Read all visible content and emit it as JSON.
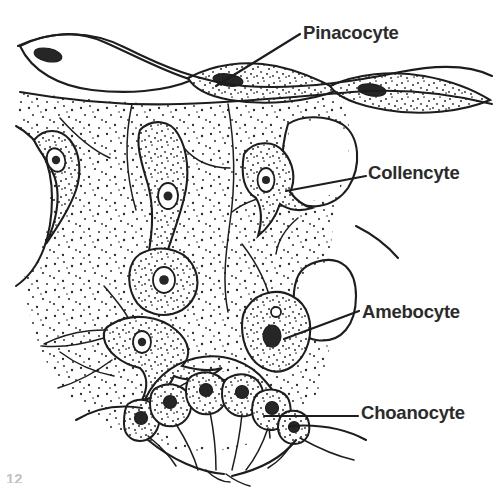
{
  "figure": {
    "corner_mark": "12",
    "ink_color": "#1d1d1d",
    "label_color": "#2b2b2b",
    "background_color": "#ffffff",
    "stipple_color": "#2a2a2a"
  },
  "labels": [
    {
      "id": "pinacocyte",
      "text": "Pinacocyte",
      "leader_from": [
        216,
        86
      ],
      "leader_to": [
        300,
        34
      ],
      "describes": "flattened surface epithelial cell of the sponge pinacoderm"
    },
    {
      "id": "collencyte",
      "text": "Collencyte",
      "leader_from": [
        286,
        191
      ],
      "leader_to": [
        366,
        176
      ],
      "describes": "stellate collagen-secreting cell with long tapering processes"
    },
    {
      "id": "amebocyte",
      "text": "Amebocyte",
      "leader_from": [
        284,
        339
      ],
      "leader_to": [
        359,
        311
      ],
      "describes": "rounded motile wandering cell in the mesohyl"
    },
    {
      "id": "choanocyte",
      "text": "Choanocyte",
      "leader_from": [
        264,
        416
      ],
      "leader_to": [
        358,
        416
      ],
      "describes": "flagellated collar cell lining the choanocyte chamber"
    }
  ],
  "regions": [
    {
      "id": "mesohyl",
      "name": "mesohyl",
      "texture": "stippled"
    },
    {
      "id": "canal-left",
      "name": "incurrent canal (left)",
      "texture": "blank"
    },
    {
      "id": "canal-right",
      "name": "incurrent canal (right)",
      "texture": "blank"
    },
    {
      "id": "chamber",
      "name": "choanocyte chamber",
      "texture": "blank"
    }
  ],
  "cell_counts": {
    "pinacocytes": 3,
    "collencytes": 5,
    "amebocytes": 3,
    "choanocytes": 6
  }
}
